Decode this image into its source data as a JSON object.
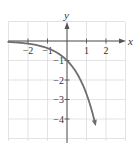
{
  "chart_data": {
    "type": "line",
    "title": "",
    "function": "y = -e^x",
    "xlabel": "x",
    "ylabel": "y",
    "xlim": [
      -3,
      3
    ],
    "ylim": [
      -5,
      1
    ],
    "grid": true,
    "x_ticks": [
      -2,
      -1,
      1,
      2
    ],
    "x_tick_labels": [
      "−2",
      "−1",
      "1",
      "2"
    ],
    "y_ticks": [
      -1,
      -2,
      -3,
      -4
    ],
    "y_tick_labels": [
      "−1",
      "−2",
      "−3",
      "−4"
    ],
    "series": [
      {
        "name": "y = -e^x",
        "color": "#6e6e6e",
        "x": [
          -3,
          -2.5,
          -2,
          -1.5,
          -1,
          -0.5,
          0,
          0.5,
          1,
          1.25,
          1.5
        ],
        "y": [
          -0.05,
          -0.08,
          -0.14,
          -0.22,
          -0.37,
          -0.61,
          -1,
          -1.65,
          -2.72,
          -3.49,
          -4.48
        ],
        "arrow_end": true,
        "left_asymptote": 0
      }
    ]
  }
}
